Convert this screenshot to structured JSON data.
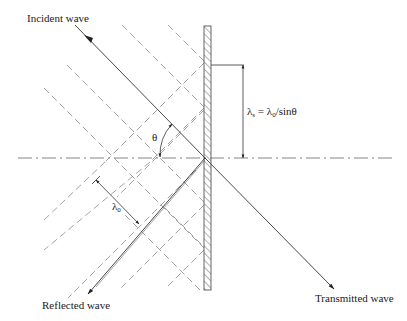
{
  "diagram": {
    "labels": {
      "incident": "Incident wave",
      "reflected": "Reflected wave",
      "transmitted": "Transmitted wave",
      "theta": "θ",
      "lambda0": "λ",
      "lambda0_sub": "0",
      "wall_wavelength_lhs": "λ",
      "wall_wavelength_lhs_sub": "s",
      "wall_wavelength_eq": " = ",
      "wall_wavelength_rhs": "λ",
      "wall_wavelength_rhs_sub": "0",
      "wall_wavelength_tail": "/sinθ"
    },
    "formula": "λs = λ0/sinθ",
    "colors": {
      "line": "#333333",
      "dash": "#8a8a8a",
      "axis": "#777777",
      "wall_hatch": "#555555",
      "background": "#ffffff"
    }
  }
}
